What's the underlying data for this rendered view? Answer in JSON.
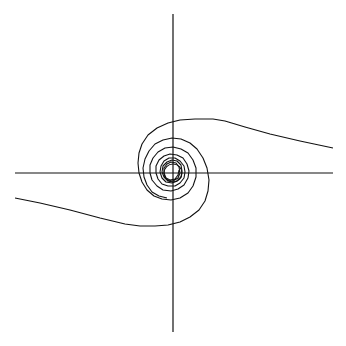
{
  "canvas": {
    "width": 346,
    "height": 346,
    "background": "#ffffff"
  },
  "colors": {
    "line": "#111111"
  },
  "chart_data": {
    "type": "line",
    "title": "",
    "xlabel": "",
    "ylabel": "",
    "grid": false,
    "legend": null,
    "axes": {
      "origin_px": [
        173,
        173
      ],
      "x_axis_px": {
        "x1": 15,
        "x2": 333,
        "y": 173
      },
      "y_axis_px": {
        "y1": 14,
        "y2": 332,
        "x": 173
      }
    },
    "series": [
      {
        "name": "trajectory-from-right",
        "points_px": [
          [
            333,
            148
          ],
          [
            300,
            141
          ],
          [
            270,
            134
          ],
          [
            245,
            127
          ],
          [
            225,
            121
          ],
          [
            213,
            119
          ],
          [
            195,
            119
          ],
          [
            180,
            120
          ],
          [
            168,
            123
          ],
          [
            157,
            128
          ],
          [
            148,
            135
          ],
          [
            142,
            144
          ],
          [
            139,
            153
          ],
          [
            138,
            163
          ],
          [
            139,
            173
          ],
          [
            142,
            182
          ],
          [
            147,
            190
          ],
          [
            154,
            196
          ],
          [
            162,
            199
          ],
          [
            171,
            200
          ],
          [
            180,
            198
          ],
          [
            188,
            193
          ],
          [
            193,
            186
          ],
          [
            196,
            177
          ],
          [
            196,
            168
          ],
          [
            193,
            160
          ],
          [
            188,
            153
          ],
          [
            181,
            149
          ],
          [
            173,
            147
          ],
          [
            165,
            148
          ],
          [
            158,
            152
          ],
          [
            153,
            158
          ],
          [
            150,
            165
          ],
          [
            150,
            173
          ],
          [
            152,
            180
          ],
          [
            157,
            186
          ],
          [
            163,
            190
          ],
          [
            171,
            191
          ],
          [
            178,
            189
          ],
          [
            184,
            185
          ],
          [
            188,
            178
          ],
          [
            189,
            171
          ],
          [
            187,
            164
          ],
          [
            183,
            158
          ],
          [
            177,
            155
          ],
          [
            170,
            154
          ],
          [
            164,
            156
          ],
          [
            159,
            160
          ],
          [
            156,
            166
          ],
          [
            156,
            173
          ],
          [
            158,
            179
          ],
          [
            162,
            184
          ],
          [
            168,
            186
          ],
          [
            175,
            186
          ],
          [
            180,
            183
          ],
          [
            184,
            178
          ],
          [
            185,
            172
          ],
          [
            184,
            166
          ],
          [
            180,
            161
          ],
          [
            175,
            158
          ],
          [
            169,
            158
          ],
          [
            164,
            161
          ],
          [
            161,
            166
          ],
          [
            160,
            172
          ],
          [
            162,
            178
          ],
          [
            166,
            182
          ],
          [
            172,
            183
          ],
          [
            177,
            181
          ],
          [
            181,
            177
          ],
          [
            182,
            171
          ],
          [
            181,
            165
          ],
          [
            177,
            161
          ],
          [
            172,
            160
          ],
          [
            167,
            162
          ],
          [
            163,
            166
          ],
          [
            162,
            172
          ],
          [
            164,
            177
          ],
          [
            168,
            181
          ],
          [
            173,
            181
          ],
          [
            178,
            178
          ],
          [
            180,
            173
          ],
          [
            179,
            167
          ],
          [
            176,
            163
          ],
          [
            171,
            162
          ],
          [
            167,
            164
          ],
          [
            164,
            168
          ],
          [
            164,
            173
          ],
          [
            166,
            178
          ],
          [
            170,
            180
          ],
          [
            175,
            179
          ],
          [
            178,
            175
          ],
          [
            179,
            170
          ]
        ]
      },
      {
        "name": "trajectory-from-left",
        "points_px": [
          [
            15,
            198
          ],
          [
            40,
            203
          ],
          [
            70,
            210
          ],
          [
            100,
            218
          ],
          [
            125,
            224
          ],
          [
            140,
            226
          ],
          [
            155,
            226
          ],
          [
            168,
            225
          ],
          [
            180,
            222
          ],
          [
            190,
            217
          ],
          [
            199,
            210
          ],
          [
            205,
            201
          ],
          [
            208,
            191
          ],
          [
            209,
            180
          ],
          [
            207,
            168
          ],
          [
            203,
            158
          ],
          [
            197,
            149
          ],
          [
            190,
            143
          ],
          [
            181,
            139
          ],
          [
            172,
            138
          ],
          [
            163,
            140
          ],
          [
            155,
            144
          ],
          [
            149,
            151
          ],
          [
            145,
            159
          ],
          [
            143,
            168
          ],
          [
            144,
            177
          ],
          [
            147,
            185
          ],
          [
            152,
            192
          ],
          [
            159,
            196
          ],
          [
            167,
            198
          ]
        ]
      },
      {
        "name": "limit-cycle",
        "shape": "circle",
        "center_px": [
          173,
          173
        ],
        "radius_px": 9
      }
    ]
  }
}
